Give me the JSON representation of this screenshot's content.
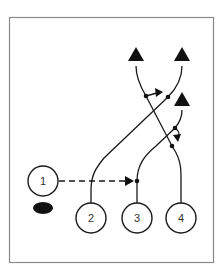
{
  "diagram": {
    "type": "play-diagram",
    "players": [
      {
        "id": "player-1",
        "label": "1"
      },
      {
        "id": "player-2",
        "label": "2"
      },
      {
        "id": "player-3",
        "label": "3"
      },
      {
        "id": "player-4",
        "label": "4"
      }
    ],
    "ball": {
      "description": "black football"
    },
    "targets": [
      {
        "id": "target-left",
        "shape": "triangle"
      },
      {
        "id": "target-right",
        "shape": "triangle"
      },
      {
        "id": "target-lower-right",
        "shape": "triangle"
      }
    ],
    "routes": [
      {
        "from": "player-1",
        "to": "player-3",
        "style": "dashed",
        "meaning": "pass"
      },
      {
        "from": "player-2",
        "to": "target-right",
        "style": "solid"
      },
      {
        "from": "player-3",
        "to": "target-lower-right",
        "style": "solid"
      },
      {
        "from": "player-4",
        "to": "target-left",
        "style": "solid"
      }
    ],
    "colors": {
      "stroke": "#1a1a1a",
      "frame": "#8a8a8a",
      "fill": "#111111"
    }
  }
}
